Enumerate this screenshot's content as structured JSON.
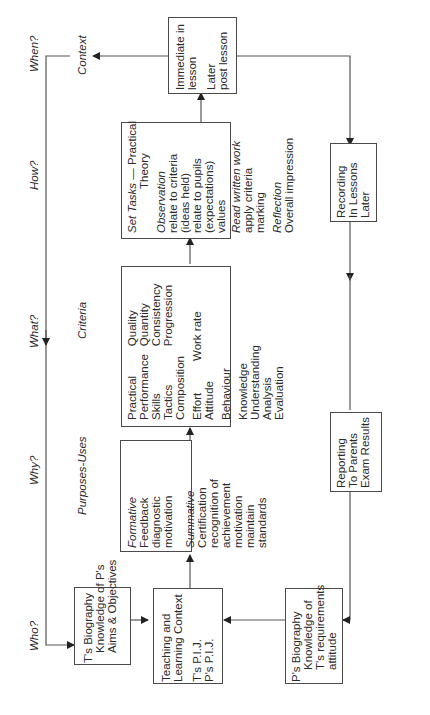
{
  "questions": {
    "when": "When?",
    "how": "How?",
    "what": "What?",
    "why": "Why?",
    "who": "Who?"
  },
  "headings": {
    "context": "Context",
    "criteria": "Criteria",
    "purposes": "Purposes-Uses"
  },
  "boxes": {
    "immediate": [
      "Immediate in",
      "lesson",
      "",
      "Later",
      "post lesson"
    ],
    "set_tasks": {
      "title_italic": "Set Tasks",
      "title_rest": " — Practical",
      "title_line2": "Theory",
      "observation": "Observation",
      "observation_lines": [
        "relate to criteria",
        "(ideas held)",
        "relate to pupils",
        "(expectations)",
        "values"
      ],
      "read": "Read written work",
      "read_lines": [
        "apply criteria",
        "marking"
      ],
      "reflection": "Reflection",
      "reflection_lines": [
        "Overall impression"
      ]
    },
    "criteria": {
      "col1a": [
        "Practical",
        "Performance",
        "Skills",
        "Tactics",
        "Composition"
      ],
      "col2a": [
        "Quality",
        "Quantity",
        "Consistency",
        "Progression"
      ],
      "col1b": [
        "Effort",
        "Attitude"
      ],
      "col2b": [
        "Work rate"
      ],
      "behaviour": "Behaviour",
      "cognitive": [
        "Knowledge",
        "Understanding",
        "Analysis",
        "Evaluation"
      ]
    },
    "purposes": {
      "formative": "Formative",
      "formative_lines": [
        "Feedback",
        "diagnostic",
        "motivation"
      ],
      "summative": "Summative",
      "summative_lines": [
        "Certification",
        "recognition of",
        "achievement",
        "motivation",
        "maintain",
        "standards"
      ]
    },
    "t_biography": [
      "T's Biography",
      "Knowledge of P's",
      "Aims & Objectives"
    ],
    "teaching_context": [
      "Teaching and",
      "Learning Context",
      "",
      "T's P.I.J.",
      "P's P.I.J."
    ],
    "p_biography": [
      "P's Biography",
      "Knowledge of",
      "T's requirements",
      "attitude"
    ],
    "recording": [
      "Recording",
      "In Lessons",
      "Later"
    ],
    "reporting": [
      "Reporting",
      "To Parents",
      "Exam Results"
    ]
  }
}
